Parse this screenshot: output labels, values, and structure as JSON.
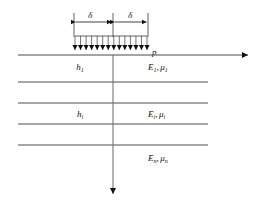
{
  "figure": {
    "type": "layered-elastic-halfspace-diagram",
    "title": "",
    "colors": {
      "line": "#3a3a3a",
      "surface_line": "#4a4a4a",
      "arrow": "#111111",
      "text": "#111111",
      "background": "#ffffff"
    },
    "dimension": {
      "left_label": "δ",
      "right_label": "δ",
      "left_span_x": [
        74,
        113
      ],
      "right_span_x": [
        113,
        148
      ],
      "y": 22
    },
    "load": {
      "label": "p",
      "arrow_count": 14,
      "x_start": 75,
      "x_end": 147,
      "top_y": 36,
      "bottom_y": 55
    },
    "surface": {
      "y": 55,
      "x_start": 18,
      "x_end": 250,
      "arrow_direction": "right"
    },
    "axis": {
      "x": 113,
      "top_y": 55,
      "bottom_y": 196,
      "arrow_direction": "down"
    },
    "interfaces": [
      {
        "y": 82,
        "x_start": 18,
        "x_end": 208
      },
      {
        "y": 103,
        "x_start": 18,
        "x_end": 208
      },
      {
        "y": 124,
        "x_start": 18,
        "x_end": 208
      },
      {
        "y": 145,
        "x_start": 18,
        "x_end": 208
      }
    ],
    "layers": [
      {
        "id": "layer-1",
        "thickness_symbol": "h",
        "thickness_subscript": "1",
        "modulus_symbol": "E",
        "modulus_subscript": "1",
        "poisson_symbol": "μ",
        "poisson_subscript": "1",
        "separator": ",",
        "thickness_pos": {
          "x": 80,
          "y": 70
        },
        "property_pos": {
          "x": 148,
          "y": 70
        }
      },
      {
        "id": "layer-i",
        "thickness_symbol": "h",
        "thickness_subscript": "i",
        "modulus_symbol": "E",
        "modulus_subscript": "i",
        "poisson_symbol": "μ",
        "poisson_subscript": "i",
        "separator": ",",
        "thickness_pos": {
          "x": 80,
          "y": 117
        },
        "property_pos": {
          "x": 148,
          "y": 117
        }
      },
      {
        "id": "layer-n",
        "thickness_symbol": "",
        "thickness_subscript": "",
        "modulus_symbol": "E",
        "modulus_subscript": "n",
        "poisson_symbol": "μ",
        "poisson_subscript": "n",
        "separator": ",",
        "property_pos": {
          "x": 148,
          "y": 161
        }
      }
    ]
  }
}
